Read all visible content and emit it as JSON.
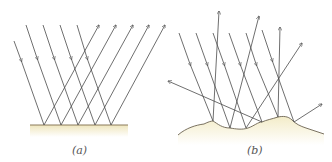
{
  "figure": {
    "panels": [
      {
        "id": "a",
        "label": "(a)",
        "description": "Specular reflection: parallel incident rays reflect from a smooth flat surface as parallel rays",
        "surface": "smooth"
      },
      {
        "id": "b",
        "label": "(b)",
        "description": "Diffuse reflection: parallel incident rays reflect from a rough surface in many directions",
        "surface": "rough"
      }
    ],
    "colors": {
      "ray": "#4a4a4a",
      "surface_line": "#8a7a5a",
      "surface_fill_top": "#f3ecc8",
      "surface_fill_bottom": "#ffffff",
      "label": "#555555"
    }
  }
}
